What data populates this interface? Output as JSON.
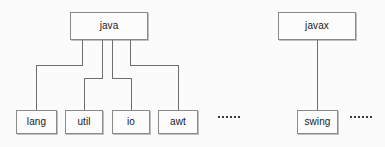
{
  "diagram": {
    "type": "package-hierarchy-tree",
    "title": "",
    "background_color": "#fbfbfb",
    "node_fill_color": "#fcfcfc",
    "node_border_color": "#8a8a8a",
    "edge_color": "#6f6f6f",
    "text_color": "#1a1a1a",
    "trees": [
      {
        "id": "java-tree",
        "root": {
          "id": "java",
          "label": "java",
          "x": 70,
          "y": 12,
          "w": 78,
          "h": 28
        },
        "children": [
          {
            "id": "lang",
            "label": "lang",
            "x": 16,
            "y": 110,
            "w": 41,
            "h": 24
          },
          {
            "id": "util",
            "label": "util",
            "x": 65,
            "y": 110,
            "w": 38,
            "h": 24
          },
          {
            "id": "io",
            "label": "io",
            "x": 112,
            "y": 110,
            "w": 38,
            "h": 24
          },
          {
            "id": "awt",
            "label": "awt",
            "x": 158,
            "y": 110,
            "w": 40,
            "h": 24
          }
        ],
        "ellipsis": {
          "id": "java-more",
          "label": "......",
          "dots": 6,
          "x": 218,
          "y": 116
        }
      },
      {
        "id": "javax-tree",
        "root": {
          "id": "javax",
          "label": "javax",
          "x": 278,
          "y": 12,
          "w": 78,
          "h": 28
        },
        "children": [
          {
            "id": "swing",
            "label": "swing",
            "x": 297,
            "y": 110,
            "w": 41,
            "h": 24
          }
        ],
        "ellipsis": {
          "id": "javax-more",
          "label": "......",
          "dots": 6,
          "x": 350,
          "y": 116
        }
      }
    ],
    "edges": [
      {
        "id": "java-to-lang",
        "from": "java",
        "to": "lang",
        "path": "M 82 40 L 82 65 L 36.5 65 L 36.5 110"
      },
      {
        "id": "java-to-util",
        "from": "java",
        "to": "util",
        "path": "M 102 40 L 102 78 L 84 78 L 84 110"
      },
      {
        "id": "java-to-io",
        "from": "java",
        "to": "io",
        "path": "M 112 40 L 112 78 L 131 78 L 131 110"
      },
      {
        "id": "java-to-awt",
        "from": "java",
        "to": "awt",
        "path": "M 130 40 L 130 65 L 178 65 L 178 110"
      },
      {
        "id": "javax-to-swing",
        "from": "javax",
        "to": "swing",
        "path": "M 317.5 40 L 317.5 110"
      }
    ]
  }
}
